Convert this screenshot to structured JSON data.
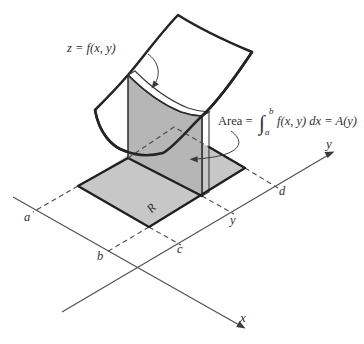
{
  "figure": {
    "surface_label": "z = f(x, y)",
    "area_label": {
      "prefix": "Area = ",
      "integral_sign": "∫",
      "upper_limit": "b",
      "lower_limit": "a",
      "suffix": "f(x, y) dx = A(y)"
    },
    "axes": {
      "x_label": "x",
      "y_label": "y"
    },
    "ticks": {
      "a": "a",
      "b": "b",
      "c": "c",
      "y": "y",
      "d": "d"
    },
    "region_label": "R",
    "colors": {
      "surface_fill": "#ffffff",
      "slab_face": "#b6b6b6",
      "slab_top_ribbon": "#d6d6d6",
      "slab_side": "#a2a2a2",
      "base_region": "#c7c7c7",
      "line": "#1f1f1f",
      "background": "#ffffff"
    }
  }
}
